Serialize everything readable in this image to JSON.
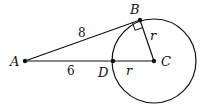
{
  "diagram": {
    "points": {
      "A": {
        "label": "A",
        "x": 25,
        "y": 61
      },
      "B": {
        "label": "B",
        "x": 140,
        "y": 20
      },
      "C": {
        "label": "C",
        "x": 154,
        "y": 61
      },
      "D": {
        "label": "D",
        "x": 113,
        "y": 61
      }
    },
    "segments": [
      {
        "from": "A",
        "to": "B",
        "label": "8"
      },
      {
        "from": "A",
        "to": "D",
        "label": "6"
      },
      {
        "from": "B",
        "to": "C",
        "label": "r"
      },
      {
        "from": "D",
        "to": "C",
        "label": "r"
      }
    ],
    "circle": {
      "center": "C",
      "radius_label": "r"
    },
    "right_angle_at": "B",
    "colors": {
      "stroke": "#111111",
      "background": "#ffffff"
    }
  }
}
